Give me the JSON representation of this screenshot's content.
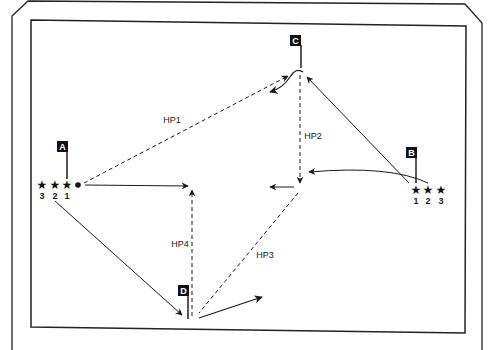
{
  "diagram": {
    "title": "",
    "colors": {
      "line": "#1a1a1a",
      "flag_bg": "#111111",
      "flag_text": "#ffffff",
      "background": "#ffffff"
    },
    "flags": [
      {
        "id": "A",
        "label": "A"
      },
      {
        "id": "B",
        "label": "B"
      },
      {
        "id": "C",
        "label": "C"
      },
      {
        "id": "D",
        "label": "D"
      }
    ],
    "player_groups": [
      {
        "at": "A",
        "icon": "star-icon",
        "numbers": [
          "3",
          "2",
          "1"
        ],
        "ball": true
      },
      {
        "at": "B",
        "icon": "star-icon",
        "numbers": [
          "1",
          "2",
          "3"
        ],
        "ball": false
      }
    ],
    "pass_labels": [
      "HP1",
      "HP2",
      "HP3",
      "HP4"
    ],
    "star_glyph": "★",
    "legend": {
      "dashed": "pass",
      "solid": "run"
    }
  }
}
